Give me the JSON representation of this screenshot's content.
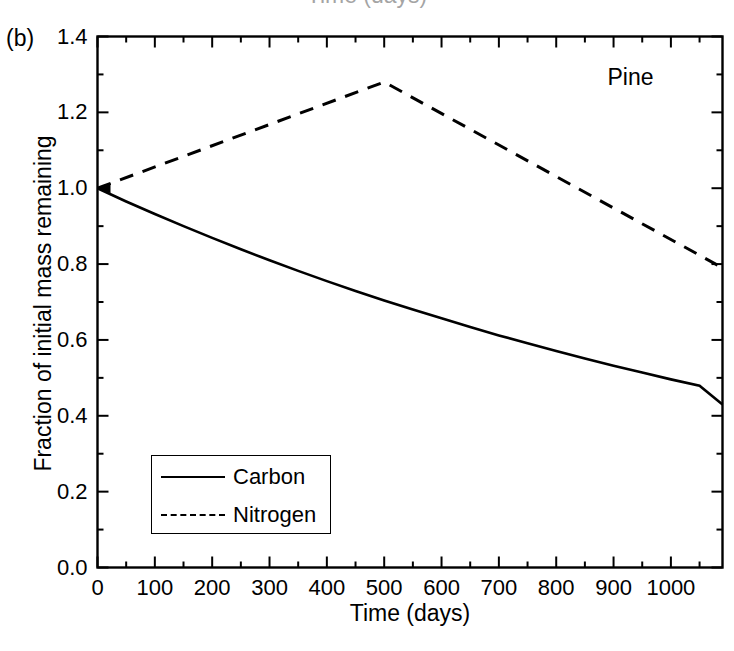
{
  "figure": {
    "panel_label": "(b)",
    "clipped_caption_above": "Time (days)",
    "group_annotation": "Pine"
  },
  "axes": {
    "x_title": "Time (days)",
    "y_title": "Fraction of initial mass remaining",
    "x_tick_labels": [
      "0",
      "100",
      "200",
      "300",
      "400",
      "500",
      "600",
      "700",
      "800",
      "900",
      "1000"
    ],
    "y_tick_labels": [
      "0.0",
      "0.2",
      "0.4",
      "0.6",
      "0.8",
      "1.0",
      "1.2",
      "1.4"
    ]
  },
  "legend": {
    "entries": [
      {
        "label": "Carbon",
        "style": "solid"
      },
      {
        "label": "Nitrogen",
        "style": "dashed"
      }
    ]
  },
  "colors": {
    "line": "#000000",
    "axis": "#000000",
    "background": "#ffffff"
  },
  "chart_data": {
    "type": "line",
    "title": "Pine",
    "subtitle": "(b)",
    "xlabel": "Time (days)",
    "ylabel": "Fraction of initial mass remaining",
    "xlim": [
      0,
      1090
    ],
    "ylim": [
      0.0,
      1.4
    ],
    "xticks": [
      0,
      100,
      200,
      300,
      400,
      500,
      600,
      700,
      800,
      900,
      1000
    ],
    "yticks": [
      0.0,
      0.2,
      0.4,
      0.6,
      0.8,
      1.0,
      1.2,
      1.4
    ],
    "x_minor_tick_interval": 50,
    "y_minor_tick_interval": 0.1,
    "grid": false,
    "legend_position": "lower-left",
    "series": [
      {
        "name": "Carbon",
        "style": "solid",
        "x": [
          0,
          50,
          100,
          150,
          200,
          250,
          300,
          350,
          400,
          450,
          500,
          550,
          600,
          650,
          700,
          750,
          800,
          850,
          900,
          950,
          1000,
          1050,
          1090
        ],
        "values": [
          1.0,
          0.965,
          0.932,
          0.9,
          0.869,
          0.839,
          0.81,
          0.782,
          0.755,
          0.729,
          0.704,
          0.68,
          0.657,
          0.634,
          0.612,
          0.591,
          0.571,
          0.551,
          0.532,
          0.514,
          0.496,
          0.479,
          0.43
        ]
      },
      {
        "name": "Nitrogen",
        "style": "dashed",
        "x": [
          0,
          500,
          1090
        ],
        "values": [
          1.0,
          1.28,
          0.79
        ]
      }
    ]
  }
}
